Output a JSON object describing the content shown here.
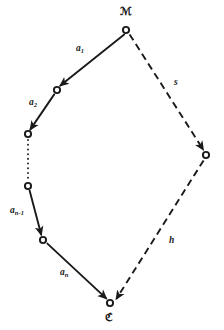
{
  "figure": {
    "type": "path-diagram",
    "background_color": "#ffffff",
    "ink_color": "#1a1a1a",
    "width": 224,
    "height": 330
  },
  "vertices": {
    "start": {
      "id": "A",
      "label": "ℳ",
      "label_text": "A",
      "x": 126,
      "y": 30
    },
    "end": {
      "id": "B",
      "label": "ℭ",
      "label_text": "B",
      "x": 110,
      "y": 303
    },
    "chain": [
      {
        "id": "v1",
        "x": 57,
        "y": 90
      },
      {
        "id": "v2",
        "x": 28,
        "y": 134
      },
      {
        "id": "v3",
        "x": 28,
        "y": 186
      },
      {
        "id": "v4",
        "x": 43,
        "y": 240
      }
    ],
    "right": {
      "id": "r1",
      "x": 206,
      "y": 155
    }
  },
  "edges": {
    "solid_chain": [
      {
        "name": "a1",
        "base": "a",
        "sub": "1",
        "from": "A",
        "to": "v1",
        "style": "solid",
        "arrow": true
      },
      {
        "name": "a2",
        "base": "a",
        "sub": "2",
        "from": "v1",
        "to": "v2",
        "style": "solid",
        "arrow": true
      },
      {
        "name": "gap",
        "base": "",
        "sub": "",
        "from": "v2",
        "to": "v3",
        "style": "dotted",
        "arrow": false
      },
      {
        "name": "an1",
        "base": "a",
        "sub": "n-1",
        "from": "v3",
        "to": "v4",
        "style": "solid",
        "arrow": true
      },
      {
        "name": "an",
        "base": "a",
        "sub": "n",
        "from": "v4",
        "to": "B",
        "style": "solid",
        "arrow": true
      }
    ],
    "dashed_path": [
      {
        "name": "s",
        "base": "s",
        "sub": "",
        "from": "A",
        "to": "r1",
        "style": "dashed",
        "arrow": true
      },
      {
        "name": "h",
        "base": "h",
        "sub": "",
        "from": "r1",
        "to": "B",
        "style": "dashed",
        "arrow": true
      }
    ]
  },
  "labels": {
    "a1_base": "a",
    "a1_sub": "1",
    "a2_base": "a",
    "a2_sub": "2",
    "an1_base": "a",
    "an1_sub": "n-1",
    "an_base": "a",
    "an_sub": "n",
    "s": "s",
    "h": "h",
    "vertex_a": "ℳ",
    "vertex_b": "ℭ"
  }
}
